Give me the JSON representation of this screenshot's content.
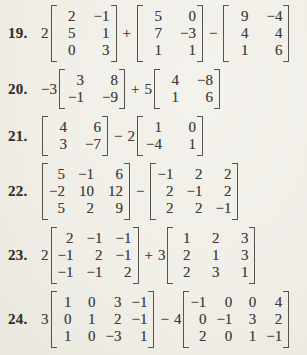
{
  "page": {
    "background_color": "#f1efe8",
    "ink_color": "#3f3e3b"
  },
  "problems": [
    {
      "number": "19.",
      "terms": [
        {
          "type": "scalar",
          "text": "2"
        },
        {
          "type": "matrix",
          "rows": [
            [
              "2",
              "−1"
            ],
            [
              "5",
              "1"
            ],
            [
              "0",
              "3"
            ]
          ]
        },
        {
          "type": "op",
          "text": "+"
        },
        {
          "type": "matrix",
          "rows": [
            [
              "5",
              "0"
            ],
            [
              "7",
              "−3"
            ],
            [
              "1",
              "1"
            ]
          ]
        },
        {
          "type": "op",
          "text": "−"
        },
        {
          "type": "matrix",
          "rows": [
            [
              "9",
              "−4"
            ],
            [
              "4",
              "4"
            ],
            [
              "1",
              "6"
            ]
          ]
        }
      ]
    },
    {
      "number": "20.",
      "terms": [
        {
          "type": "scalar",
          "text": "−3"
        },
        {
          "type": "matrix",
          "rows": [
            [
              "3",
              "8"
            ],
            [
              "−1",
              "−9"
            ]
          ]
        },
        {
          "type": "op",
          "text": "+"
        },
        {
          "type": "scalar",
          "text": "5"
        },
        {
          "type": "matrix",
          "rows": [
            [
              "4",
              "−8"
            ],
            [
              "1",
              "6"
            ]
          ]
        }
      ]
    },
    {
      "number": "21.",
      "terms": [
        {
          "type": "matrix",
          "rows": [
            [
              "4",
              "6"
            ],
            [
              "3",
              "−7"
            ]
          ]
        },
        {
          "type": "op",
          "text": "−"
        },
        {
          "type": "scalar",
          "text": "2"
        },
        {
          "type": "matrix",
          "rows": [
            [
              "1",
              "0"
            ],
            [
              "−4",
              "1"
            ]
          ]
        }
      ]
    },
    {
      "number": "22.",
      "terms": [
        {
          "type": "matrix",
          "rows": [
            [
              "5",
              "−1",
              "6"
            ],
            [
              "−2",
              "10",
              "12"
            ],
            [
              "5",
              "2",
              "9"
            ]
          ]
        },
        {
          "type": "op",
          "text": "−"
        },
        {
          "type": "matrix",
          "rows": [
            [
              "−1",
              "2",
              "2"
            ],
            [
              "2",
              "−1",
              "2"
            ],
            [
              "2",
              "2",
              "−1"
            ]
          ]
        }
      ]
    },
    {
      "number": "23.",
      "terms": [
        {
          "type": "scalar",
          "text": "2"
        },
        {
          "type": "matrix",
          "rows": [
            [
              "2",
              "−1",
              "−1"
            ],
            [
              "−1",
              "2",
              "−1"
            ],
            [
              "−1",
              "−1",
              "2"
            ]
          ]
        },
        {
          "type": "op",
          "text": "+"
        },
        {
          "type": "scalar",
          "text": "3"
        },
        {
          "type": "matrix",
          "rows": [
            [
              "1",
              "2",
              "3"
            ],
            [
              "2",
              "1",
              "3"
            ],
            [
              "2",
              "3",
              "1"
            ]
          ]
        }
      ]
    },
    {
      "number": "24.",
      "terms": [
        {
          "type": "scalar",
          "text": "3"
        },
        {
          "type": "matrix",
          "rows": [
            [
              "1",
              "0",
              "3",
              "−1"
            ],
            [
              "0",
              "1",
              "2",
              "−1"
            ],
            [
              "1",
              "0",
              "−3",
              "1"
            ]
          ]
        },
        {
          "type": "op",
          "text": "−"
        },
        {
          "type": "scalar",
          "text": "4"
        },
        {
          "type": "matrix",
          "rows": [
            [
              "−1",
              "0",
              "0",
              "4"
            ],
            [
              "0",
              "−1",
              "3",
              "2"
            ],
            [
              "2",
              "0",
              "1",
              "−1"
            ]
          ]
        }
      ]
    }
  ]
}
